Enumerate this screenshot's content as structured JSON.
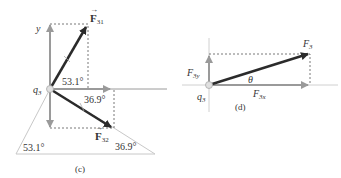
{
  "panel_c": {
    "caption": "(c)",
    "origin_label": "q",
    "origin_sub": "3",
    "y_axis_label": "y",
    "f31_label": "F",
    "f31_sub": "31",
    "f32_label": "F",
    "f32_sub": "32",
    "angle_upper": "53.1°",
    "angle_lower": "36.9°",
    "triangle_left_angle": "53.1°",
    "triangle_right_angle": "36.9°"
  },
  "panel_d": {
    "caption": "(d)",
    "origin_label": "q",
    "origin_sub": "3",
    "f3_label": "F",
    "f3_sub": "3",
    "f3y_label": "F",
    "f3y_sub": "3y",
    "f3x_label": "F",
    "f3x_sub": "3x",
    "theta_label": "θ"
  },
  "colors": {
    "vector_dark": "#2b2b2b",
    "component_gray": "#9a9a9a",
    "axis_light": "#c8c8c8",
    "dashed": "#555555",
    "text": "#333333"
  }
}
